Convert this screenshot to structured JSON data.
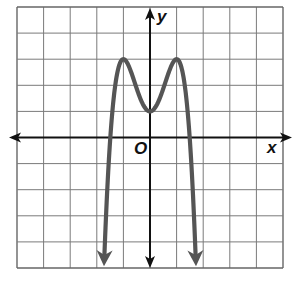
{
  "chart_data": {
    "type": "line",
    "title": "",
    "xlabel": "x",
    "ylabel": "y",
    "origin_label": "O",
    "xlim": [
      -5,
      5
    ],
    "ylim": [
      -5,
      5
    ],
    "grid": true,
    "grid_step": 1,
    "tick_labels": false,
    "series": [
      {
        "name": "f(x) = -2x^4 + 4x^2 + 1",
        "color": "#555555",
        "end_arrows": true,
        "key_points": [
          {
            "x": -1.73,
            "y": -5,
            "note": "arrow end"
          },
          {
            "x": -1.49,
            "y": 0,
            "note": "x-intercept"
          },
          {
            "x": -1,
            "y": 3,
            "note": "local max"
          },
          {
            "x": 0,
            "y": 1,
            "note": "local min / y-intercept"
          },
          {
            "x": 1,
            "y": 3,
            "note": "local max"
          },
          {
            "x": 1.49,
            "y": 0,
            "note": "x-intercept"
          },
          {
            "x": 1.73,
            "y": -5,
            "note": "arrow end"
          }
        ]
      }
    ]
  },
  "style": {
    "axis_color": "#111111",
    "grid_color": "#7a7a7a",
    "curve_color": "#555555",
    "border_color": "#666666"
  },
  "geometry": {
    "grid_left": 17,
    "grid_right": 283,
    "grid_top": 7,
    "grid_bottom": 268,
    "origin_x": 151,
    "origin_y": 137
  }
}
